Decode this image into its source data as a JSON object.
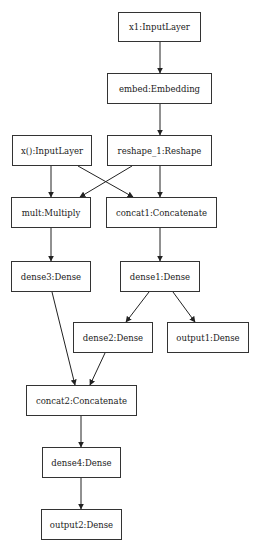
{
  "diagram": {
    "type": "neural-network-model-graph",
    "nodes": [
      {
        "id": "x1",
        "label": "x1:InputLayer",
        "x": 118,
        "y": 12,
        "w": 83,
        "h": 30
      },
      {
        "id": "embed",
        "label": "embed:Embedding",
        "x": 107,
        "y": 73,
        "w": 105,
        "h": 31
      },
      {
        "id": "x0",
        "label": "x():InputLayer",
        "x": 12,
        "y": 135,
        "w": 80,
        "h": 31
      },
      {
        "id": "reshape",
        "label": "reshape_1:Reshape",
        "x": 107,
        "y": 135,
        "w": 105,
        "h": 31
      },
      {
        "id": "mult",
        "label": "mult:Multiply",
        "x": 11,
        "y": 197,
        "w": 80,
        "h": 31
      },
      {
        "id": "concat1",
        "label": "concat1:Concatenate",
        "x": 106,
        "y": 197,
        "w": 111,
        "h": 31
      },
      {
        "id": "dense3",
        "label": "dense3:Dense",
        "x": 11,
        "y": 261,
        "w": 80,
        "h": 31
      },
      {
        "id": "dense1",
        "label": "dense1:Dense",
        "x": 120,
        "y": 261,
        "w": 80,
        "h": 31
      },
      {
        "id": "dense2",
        "label": "dense2:Dense",
        "x": 73,
        "y": 322,
        "w": 80,
        "h": 31
      },
      {
        "id": "output1",
        "label": "output1:Dense",
        "x": 167,
        "y": 322,
        "w": 82,
        "h": 31
      },
      {
        "id": "concat2",
        "label": "concat2:Concatenate",
        "x": 26,
        "y": 385,
        "w": 111,
        "h": 31
      },
      {
        "id": "dense4",
        "label": "dense4:Dense",
        "x": 42,
        "y": 447,
        "w": 79,
        "h": 31
      },
      {
        "id": "output2",
        "label": "output2:Dense",
        "x": 41,
        "y": 509,
        "w": 81,
        "h": 31
      }
    ],
    "edges": [
      {
        "from": "x1",
        "to": "embed",
        "x1": 160,
        "y1": 42,
        "x2": 160,
        "y2": 73
      },
      {
        "from": "embed",
        "to": "reshape",
        "x1": 160,
        "y1": 104,
        "x2": 160,
        "y2": 135
      },
      {
        "from": "x0",
        "to": "mult",
        "x1": 51,
        "y1": 166,
        "x2": 51,
        "y2": 197
      },
      {
        "from": "x0",
        "to": "concat1",
        "x1": 78,
        "y1": 166,
        "x2": 133,
        "y2": 197
      },
      {
        "from": "reshape",
        "to": "mult",
        "x1": 132,
        "y1": 166,
        "x2": 80,
        "y2": 197
      },
      {
        "from": "reshape",
        "to": "concat1",
        "x1": 160,
        "y1": 166,
        "x2": 160,
        "y2": 197
      },
      {
        "from": "mult",
        "to": "dense3",
        "x1": 51,
        "y1": 228,
        "x2": 51,
        "y2": 261
      },
      {
        "from": "concat1",
        "to": "dense1",
        "x1": 160,
        "y1": 228,
        "x2": 160,
        "y2": 261
      },
      {
        "from": "dense1",
        "to": "dense2",
        "x1": 149,
        "y1": 292,
        "x2": 126,
        "y2": 322
      },
      {
        "from": "dense1",
        "to": "output1",
        "x1": 173,
        "y1": 292,
        "x2": 195,
        "y2": 322
      },
      {
        "from": "dense3",
        "to": "concat2",
        "x1": 52,
        "y1": 292,
        "x2": 75,
        "y2": 385
      },
      {
        "from": "dense2",
        "to": "concat2",
        "x1": 105,
        "y1": 353,
        "x2": 90,
        "y2": 385
      },
      {
        "from": "concat2",
        "to": "dense4",
        "x1": 81,
        "y1": 416,
        "x2": 81,
        "y2": 447
      },
      {
        "from": "dense4",
        "to": "output2",
        "x1": 81,
        "y1": 478,
        "x2": 81,
        "y2": 509
      }
    ],
    "colors": {
      "border": "#333333",
      "edge": "#222222",
      "text": "#222222",
      "background": "#ffffff"
    }
  }
}
